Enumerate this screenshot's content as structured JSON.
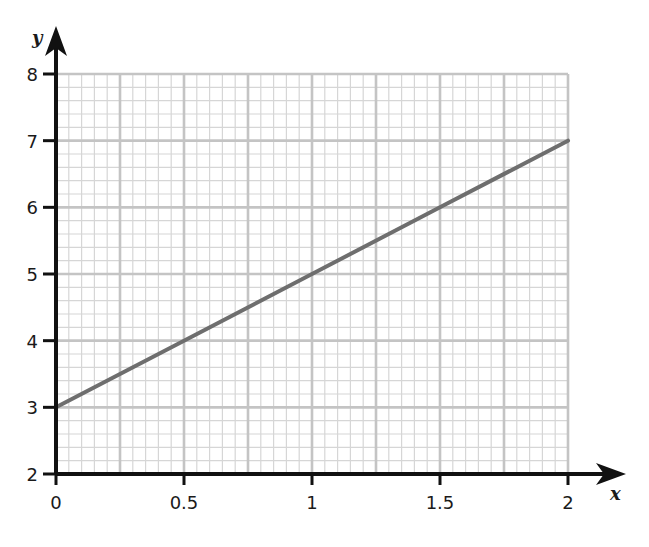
{
  "chart_data": {
    "type": "line",
    "title": "",
    "xlabel": "x",
    "ylabel": "y",
    "xlim": [
      0,
      2
    ],
    "ylim": [
      2,
      8
    ],
    "x_ticks": [
      0,
      0.5,
      1,
      1.5,
      2
    ],
    "x_tick_labels": [
      "0",
      "0.5",
      "1",
      "1.5",
      "2"
    ],
    "y_ticks": [
      2,
      3,
      4,
      5,
      6,
      7,
      8
    ],
    "y_tick_labels": [
      "2",
      "3",
      "4",
      "5",
      "6",
      "7",
      "8"
    ],
    "grid": true,
    "grid_major_x_step": 0.25,
    "grid_minor_x_step": 0.05,
    "grid_major_y_step": 1,
    "grid_minor_y_step": 0.2,
    "legend": null,
    "series": [
      {
        "name": "y = 2x + 3",
        "x": [
          0,
          0.5,
          1,
          1.5,
          2
        ],
        "y": [
          3,
          4,
          5,
          6,
          7
        ],
        "color": "#6e6e6e"
      }
    ]
  },
  "colors": {
    "axis": "#111111",
    "grid_major": "#c4c4c4",
    "grid_minor": "#d6d6d6",
    "line": "#6e6e6e",
    "background": "#ffffff"
  }
}
